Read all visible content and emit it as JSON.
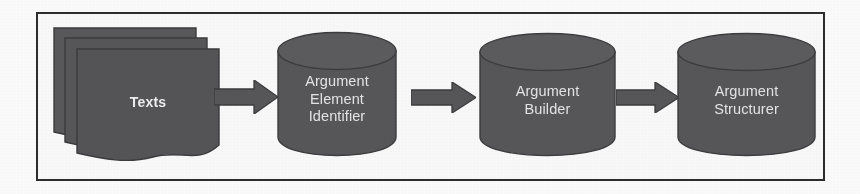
{
  "diagram": {
    "type": "pipeline-flowchart",
    "orientation": "left-to-right",
    "background_color": "#ffffff",
    "frame_color": "#2e2e2e",
    "shape_fill_color": "#58585a",
    "shape_stroke_color": "#3f3f41",
    "label_color": "#e8e8e8",
    "arrow_color": "#58585a",
    "nodes": [
      {
        "id": "texts",
        "shape": "document-stack",
        "stack_count": 3,
        "label": "Texts"
      },
      {
        "id": "argument-element-identifier",
        "shape": "cylinder",
        "label": "Argument\nElement\nIdentifier",
        "label_lines": [
          "Argument",
          "Element",
          "Identifier"
        ]
      },
      {
        "id": "argument-builder",
        "shape": "cylinder",
        "label": "Argument\nBuilder",
        "label_lines": [
          "Argument",
          "Builder"
        ]
      },
      {
        "id": "argument-structurer",
        "shape": "cylinder",
        "label": "Argument\nStructurer",
        "label_lines": [
          "Argument",
          "Structurer"
        ]
      }
    ],
    "edges": [
      {
        "id": "edge-1",
        "from": "texts",
        "to": "argument-element-identifier",
        "style": "block-arrow-right",
        "label": ""
      },
      {
        "id": "edge-2",
        "from": "argument-element-identifier",
        "to": "argument-builder",
        "style": "block-arrow-right",
        "label": ""
      },
      {
        "id": "edge-3",
        "from": "argument-builder",
        "to": "argument-structurer",
        "style": "block-arrow-right",
        "label": ""
      }
    ]
  }
}
